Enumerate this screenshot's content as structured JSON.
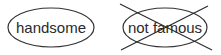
{
  "items": [
    {
      "label": "handsome",
      "crossed_out": false
    },
    {
      "label": "not famous",
      "crossed_out": true
    }
  ],
  "colors": {
    "stroke": "#333333",
    "text": "#2a2a2a",
    "background": "#ffffff"
  }
}
